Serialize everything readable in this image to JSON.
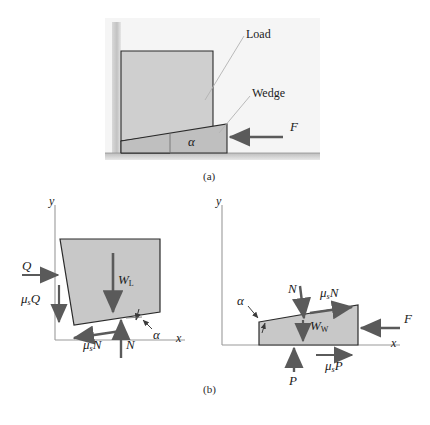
{
  "figure": {
    "captions": {
      "panel_a": "(a)",
      "panel_b": "(b)"
    }
  },
  "colors": {
    "load_fill": "#cfcfcf",
    "wedge_fill": "#bfbfbf",
    "block_fill": "#c8c8c8",
    "outline": "#2b2b2b",
    "arrow": "#5a5a5a",
    "axis": "#9a9a9a",
    "leader": "#b0b0b0",
    "panel_bg": "#f4f4f4",
    "wall": "#cccccc",
    "ground": "#c9c9c9",
    "text": "#1b1b1b"
  },
  "panel_a": {
    "caption": "(a)",
    "labels": {
      "load": "Load",
      "wedge": "Wedge",
      "force_f": "F",
      "angle": "α"
    },
    "parts": [
      "wall",
      "load-block",
      "wedge-block",
      "ground"
    ]
  },
  "panel_b": {
    "caption": "(b)",
    "left_fbd": {
      "name": "load-free-body-diagram",
      "axes": {
        "x": "x",
        "y": "y"
      },
      "forces": [
        {
          "symbol": "Q",
          "sub": "",
          "dir": "right",
          "name": "force-Q"
        },
        {
          "symbol": "μ",
          "sub": "s",
          "tail": "Q",
          "dir": "down",
          "name": "force-mu-s-Q"
        },
        {
          "symbol": "W",
          "sub": "L",
          "dir": "down",
          "name": "weight-load"
        },
        {
          "symbol": "μ",
          "sub": "s",
          "tail": "N",
          "dir": "left",
          "name": "friction-mu-s-N"
        },
        {
          "symbol": "N",
          "sub": "",
          "dir": "up",
          "name": "normal-N"
        }
      ],
      "angle": "α"
    },
    "right_fbd": {
      "name": "wedge-free-body-diagram",
      "axes": {
        "x": "x",
        "y": "y"
      },
      "forces": [
        {
          "symbol": "N",
          "sub": "",
          "dir": "down",
          "name": "normal-N"
        },
        {
          "symbol": "μ",
          "sub": "s",
          "tail": "N",
          "dir": "right",
          "name": "friction-mu-s-N"
        },
        {
          "symbol": "W",
          "sub": "W",
          "dir": "down",
          "name": "weight-wedge"
        },
        {
          "symbol": "F",
          "sub": "",
          "dir": "left",
          "name": "force-F"
        },
        {
          "symbol": "P",
          "sub": "",
          "dir": "up",
          "name": "normal-P"
        },
        {
          "symbol": "μ",
          "sub": "s",
          "tail": "P",
          "dir": "right",
          "name": "friction-mu-s-P"
        }
      ],
      "angle": "α"
    }
  }
}
